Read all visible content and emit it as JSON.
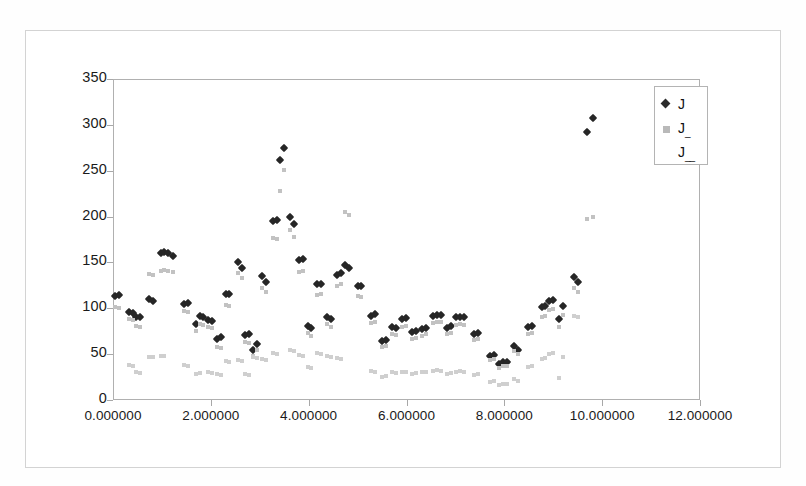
{
  "chart_data": {
    "type": "scatter",
    "title": "",
    "xlabel": "",
    "ylabel": "",
    "xlim": [
      0,
      12
    ],
    "ylim": [
      0,
      350
    ],
    "grid": false,
    "legend_position": "top-right",
    "xticks": [
      "0.000000",
      "2.000000",
      "4.000000",
      "6.000000",
      "8.000000",
      "10.000000",
      "12.000000"
    ],
    "xtick_values": [
      0,
      2,
      4,
      6,
      8,
      10,
      12
    ],
    "yticks": [
      "0",
      "50",
      "100",
      "150",
      "200",
      "250",
      "300",
      "350"
    ],
    "ytick_values": [
      0,
      50,
      100,
      150,
      200,
      250,
      300,
      350
    ],
    "series": [
      {
        "name": "J",
        "marker": "diamond",
        "color": "#262626",
        "points": [
          [
            0.05,
            113
          ],
          [
            0.12,
            114
          ],
          [
            0.33,
            96
          ],
          [
            0.4,
            95
          ],
          [
            0.48,
            91
          ],
          [
            0.55,
            90
          ],
          [
            0.74,
            110
          ],
          [
            0.82,
            108
          ],
          [
            0.98,
            160
          ],
          [
            1.05,
            161
          ],
          [
            1.12,
            160
          ],
          [
            1.22,
            157
          ],
          [
            1.46,
            105
          ],
          [
            1.53,
            106
          ],
          [
            1.7,
            83
          ],
          [
            1.77,
            92
          ],
          [
            1.84,
            91
          ],
          [
            1.95,
            87
          ],
          [
            2.02,
            86
          ],
          [
            2.12,
            66
          ],
          [
            2.2,
            69
          ],
          [
            2.3,
            116
          ],
          [
            2.38,
            116
          ],
          [
            2.55,
            151
          ],
          [
            2.63,
            144
          ],
          [
            2.7,
            71
          ],
          [
            2.78,
            72
          ],
          [
            2.86,
            55
          ],
          [
            2.95,
            61
          ],
          [
            3.05,
            135
          ],
          [
            3.12,
            129
          ],
          [
            3.28,
            195
          ],
          [
            3.35,
            196
          ],
          [
            3.42,
            262
          ],
          [
            3.5,
            275
          ],
          [
            3.62,
            200
          ],
          [
            3.7,
            192
          ],
          [
            3.8,
            153
          ],
          [
            3.88,
            154
          ],
          [
            3.98,
            81
          ],
          [
            4.05,
            78
          ],
          [
            4.18,
            126
          ],
          [
            4.26,
            127
          ],
          [
            4.38,
            91
          ],
          [
            4.46,
            88
          ],
          [
            4.58,
            136
          ],
          [
            4.66,
            139
          ],
          [
            4.74,
            147
          ],
          [
            4.82,
            144
          ],
          [
            5.0,
            124
          ],
          [
            5.08,
            124
          ],
          [
            5.28,
            92
          ],
          [
            5.35,
            94
          ],
          [
            5.5,
            64
          ],
          [
            5.58,
            65
          ],
          [
            5.7,
            80
          ],
          [
            5.78,
            79
          ],
          [
            5.9,
            88
          ],
          [
            5.98,
            89
          ],
          [
            6.12,
            74
          ],
          [
            6.2,
            75
          ],
          [
            6.32,
            77
          ],
          [
            6.4,
            79
          ],
          [
            6.55,
            92
          ],
          [
            6.63,
            93
          ],
          [
            6.7,
            93
          ],
          [
            6.82,
            79
          ],
          [
            6.9,
            81
          ],
          [
            7.02,
            90
          ],
          [
            7.1,
            91
          ],
          [
            7.18,
            90
          ],
          [
            7.38,
            72
          ],
          [
            7.46,
            73
          ],
          [
            7.7,
            48
          ],
          [
            7.78,
            49
          ],
          [
            7.9,
            39
          ],
          [
            7.98,
            41
          ],
          [
            8.06,
            41
          ],
          [
            8.2,
            59
          ],
          [
            8.28,
            55
          ],
          [
            8.48,
            80
          ],
          [
            8.56,
            81
          ],
          [
            8.76,
            101
          ],
          [
            8.84,
            102
          ],
          [
            8.92,
            108
          ],
          [
            9.0,
            109
          ],
          [
            9.12,
            88
          ],
          [
            9.2,
            103
          ],
          [
            9.42,
            134
          ],
          [
            9.5,
            129
          ],
          [
            9.7,
            292
          ],
          [
            9.82,
            308
          ]
        ]
      },
      {
        "name": "J_",
        "marker": "square",
        "color": "#c2c2c2",
        "points": [
          [
            0.05,
            101
          ],
          [
            0.12,
            100
          ],
          [
            0.33,
            88
          ],
          [
            0.4,
            87
          ],
          [
            0.48,
            81
          ],
          [
            0.55,
            80
          ],
          [
            0.74,
            137
          ],
          [
            0.82,
            136
          ],
          [
            0.98,
            141
          ],
          [
            1.05,
            142
          ],
          [
            1.12,
            141
          ],
          [
            1.22,
            140
          ],
          [
            1.46,
            97
          ],
          [
            1.53,
            96
          ],
          [
            1.7,
            75
          ],
          [
            1.77,
            83
          ],
          [
            1.84,
            82
          ],
          [
            1.95,
            80
          ],
          [
            2.02,
            79
          ],
          [
            2.12,
            58
          ],
          [
            2.2,
            57
          ],
          [
            2.3,
            104
          ],
          [
            2.38,
            103
          ],
          [
            2.55,
            139
          ],
          [
            2.63,
            133
          ],
          [
            2.7,
            63
          ],
          [
            2.78,
            62
          ],
          [
            2.86,
            48
          ],
          [
            2.95,
            54
          ],
          [
            3.05,
            122
          ],
          [
            3.12,
            118
          ],
          [
            3.28,
            177
          ],
          [
            3.35,
            176
          ],
          [
            3.42,
            228
          ],
          [
            3.5,
            251
          ],
          [
            3.62,
            185
          ],
          [
            3.7,
            178
          ],
          [
            3.8,
            140
          ],
          [
            3.88,
            141
          ],
          [
            3.98,
            73
          ],
          [
            4.05,
            70
          ],
          [
            4.18,
            115
          ],
          [
            4.26,
            116
          ],
          [
            4.38,
            83
          ],
          [
            4.46,
            80
          ],
          [
            4.58,
            124
          ],
          [
            4.66,
            126
          ],
          [
            4.74,
            205
          ],
          [
            4.82,
            202
          ],
          [
            5.0,
            113
          ],
          [
            5.08,
            112
          ],
          [
            5.28,
            84
          ],
          [
            5.35,
            85
          ],
          [
            5.5,
            58
          ],
          [
            5.58,
            59
          ],
          [
            5.7,
            72
          ],
          [
            5.78,
            71
          ],
          [
            5.9,
            80
          ],
          [
            5.98,
            81
          ],
          [
            6.12,
            67
          ],
          [
            6.2,
            68
          ],
          [
            6.32,
            70
          ],
          [
            6.4,
            72
          ],
          [
            6.55,
            84
          ],
          [
            6.63,
            85
          ],
          [
            6.7,
            85
          ],
          [
            6.82,
            72
          ],
          [
            6.9,
            73
          ],
          [
            7.02,
            82
          ],
          [
            7.1,
            83
          ],
          [
            7.18,
            82
          ],
          [
            7.38,
            65
          ],
          [
            7.46,
            66
          ],
          [
            7.7,
            44
          ],
          [
            7.78,
            45
          ],
          [
            7.9,
            35
          ],
          [
            7.98,
            37
          ],
          [
            8.06,
            37
          ],
          [
            8.2,
            53
          ],
          [
            8.28,
            50
          ],
          [
            8.48,
            72
          ],
          [
            8.56,
            73
          ],
          [
            8.76,
            91
          ],
          [
            8.84,
            92
          ],
          [
            8.92,
            98
          ],
          [
            9.0,
            99
          ],
          [
            9.12,
            80
          ],
          [
            9.2,
            93
          ],
          [
            9.42,
            122
          ],
          [
            9.5,
            118
          ],
          [
            9.7,
            197
          ],
          [
            9.82,
            200
          ]
        ]
      },
      {
        "name": "J__",
        "marker": "none",
        "color": "#cfcfcf",
        "points": [
          [
            0.33,
            38
          ],
          [
            0.4,
            37
          ],
          [
            0.48,
            30
          ],
          [
            0.55,
            29
          ],
          [
            0.74,
            47
          ],
          [
            0.82,
            47
          ],
          [
            0.98,
            48
          ],
          [
            1.05,
            48
          ],
          [
            1.46,
            38
          ],
          [
            1.53,
            37
          ],
          [
            1.7,
            28
          ],
          [
            1.77,
            29
          ],
          [
            1.95,
            30
          ],
          [
            2.02,
            29
          ],
          [
            2.12,
            28
          ],
          [
            2.2,
            27
          ],
          [
            2.3,
            42
          ],
          [
            2.38,
            41
          ],
          [
            2.55,
            44
          ],
          [
            2.63,
            43
          ],
          [
            2.7,
            28
          ],
          [
            2.78,
            27
          ],
          [
            2.86,
            47
          ],
          [
            2.95,
            46
          ],
          [
            3.05,
            45
          ],
          [
            3.12,
            44
          ],
          [
            3.28,
            51
          ],
          [
            3.35,
            50
          ],
          [
            3.62,
            54
          ],
          [
            3.7,
            53
          ],
          [
            3.8,
            49
          ],
          [
            3.88,
            48
          ],
          [
            3.98,
            36
          ],
          [
            4.05,
            35
          ],
          [
            4.18,
            51
          ],
          [
            4.26,
            50
          ],
          [
            4.38,
            48
          ],
          [
            4.46,
            47
          ],
          [
            4.58,
            46
          ],
          [
            4.66,
            45
          ],
          [
            5.28,
            32
          ],
          [
            5.35,
            31
          ],
          [
            5.5,
            25
          ],
          [
            5.58,
            26
          ],
          [
            5.7,
            30
          ],
          [
            5.78,
            29
          ],
          [
            5.9,
            30
          ],
          [
            5.98,
            31
          ],
          [
            6.12,
            28
          ],
          [
            6.2,
            29
          ],
          [
            6.32,
            30
          ],
          [
            6.4,
            31
          ],
          [
            6.55,
            32
          ],
          [
            6.63,
            33
          ],
          [
            6.7,
            32
          ],
          [
            6.82,
            28
          ],
          [
            6.9,
            29
          ],
          [
            7.02,
            31
          ],
          [
            7.1,
            32
          ],
          [
            7.18,
            31
          ],
          [
            7.38,
            27
          ],
          [
            7.46,
            28
          ],
          [
            7.7,
            20
          ],
          [
            7.78,
            21
          ],
          [
            7.9,
            16
          ],
          [
            7.98,
            17
          ],
          [
            8.06,
            17
          ],
          [
            8.2,
            23
          ],
          [
            8.28,
            21
          ],
          [
            8.48,
            36
          ],
          [
            8.56,
            37
          ],
          [
            8.76,
            45
          ],
          [
            8.84,
            46
          ],
          [
            8.92,
            50
          ],
          [
            9.0,
            51
          ],
          [
            9.12,
            24
          ],
          [
            9.2,
            47
          ],
          [
            9.42,
            92
          ],
          [
            9.5,
            91
          ]
        ]
      }
    ]
  },
  "legend": {
    "entries": [
      {
        "label": "J",
        "sub": "",
        "marker": "diamond"
      },
      {
        "label": "J",
        "sub": "_",
        "marker": "square"
      },
      {
        "label": "J",
        "sub": "__",
        "marker": "none"
      }
    ]
  }
}
